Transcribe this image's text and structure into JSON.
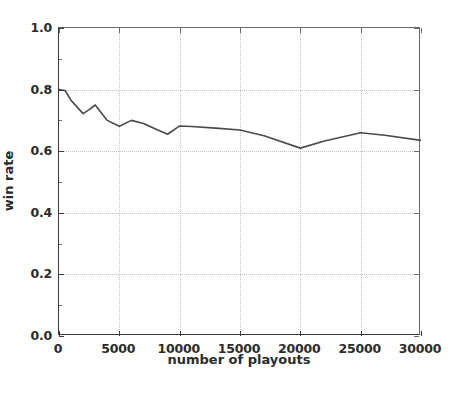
{
  "chart_data": {
    "type": "line",
    "title": "",
    "subtitle": "",
    "xlabel": "number of playouts",
    "ylabel": "win rate",
    "xlim": [
      0,
      30000
    ],
    "ylim": [
      0.0,
      1.0
    ],
    "xticks": [
      0,
      5000,
      10000,
      15000,
      20000,
      25000,
      30000
    ],
    "xticklabels": [
      "0",
      "5000",
      "10000",
      "15000",
      "20000",
      "25000",
      "30000"
    ],
    "yticks": [
      0.0,
      0.2,
      0.4,
      0.6,
      0.8,
      1.0
    ],
    "yticklabels": [
      "0.0",
      "0.2",
      "0.4",
      "0.6",
      "0.8",
      "1.0"
    ],
    "grid": true,
    "grid_style": "dotted",
    "grid_color": "#c2c2c2",
    "legend": null,
    "legend_position": "none",
    "annotations": [],
    "series": [
      {
        "name": "win rate",
        "color": "#4a4a4a",
        "linewidth": 1.6,
        "marker": "none",
        "x": [
          0,
          500,
          1000,
          2000,
          2500,
          3000,
          4000,
          5000,
          6000,
          7000,
          8000,
          9000,
          10000,
          11000,
          13000,
          15000,
          17000,
          20000,
          22000,
          25000,
          27000,
          30000
        ],
        "y": [
          0.8,
          0.797,
          0.765,
          0.722,
          0.735,
          0.75,
          0.7,
          0.681,
          0.7,
          0.69,
          0.672,
          0.655,
          0.682,
          0.68,
          0.675,
          0.669,
          0.65,
          0.61,
          0.633,
          0.66,
          0.652,
          0.635
        ]
      }
    ]
  },
  "axes": {
    "x_axis_name": "number-of-playouts-axis",
    "y_axis_name": "win-rate-axis"
  }
}
